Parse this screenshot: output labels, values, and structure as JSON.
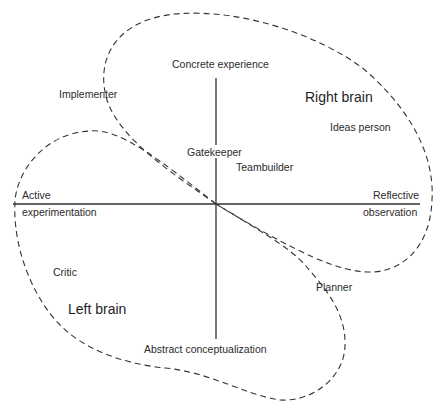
{
  "diagram": {
    "axes": {
      "top": "Concrete experience",
      "bottom": "Abstract conceptualization",
      "left_line1": "Active",
      "left_line2": "experimentation",
      "right_line1": "Reflective",
      "right_line2": "observation"
    },
    "regions": {
      "right": "Right brain",
      "left": "Left brain"
    },
    "roles": {
      "implementer": "Implementer",
      "ideas_person": "Ideas person",
      "gatekeeper": "Gatekeeper",
      "teambuilder": "Teambuilder",
      "critic": "Critic",
      "planner": "Planner"
    },
    "colors": {
      "line": "#333333",
      "text": "#2b2b2b"
    }
  }
}
